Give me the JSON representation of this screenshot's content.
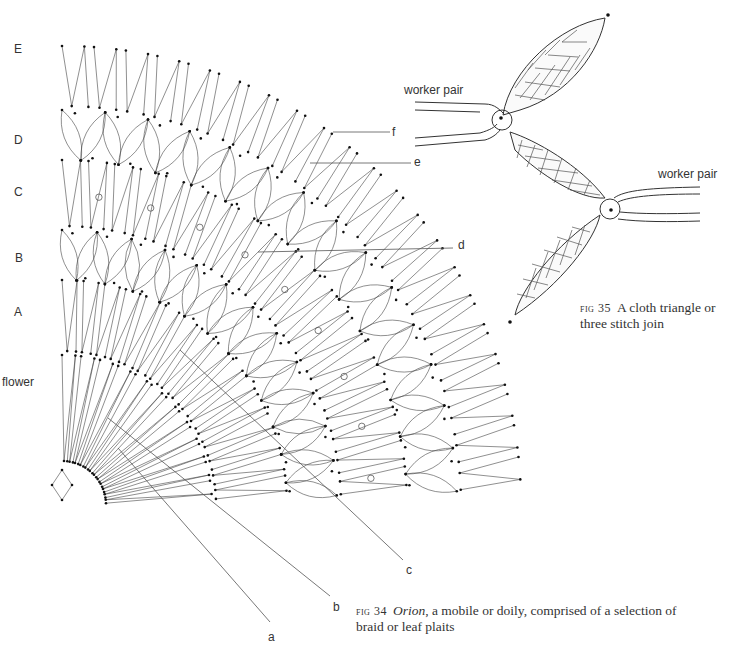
{
  "figure34": {
    "section_labels": [
      {
        "id": "E",
        "text": "E",
        "x": 14,
        "y": 70
      },
      {
        "id": "D",
        "text": "D",
        "x": 14,
        "y": 130
      },
      {
        "id": "C",
        "text": "C",
        "x": 14,
        "y": 184
      },
      {
        "id": "B",
        "text": "B",
        "x": 14,
        "y": 251
      },
      {
        "id": "A",
        "text": "A",
        "x": 14,
        "y": 306
      },
      {
        "id": "flower",
        "text": "flower",
        "x": 3,
        "y": 375
      }
    ],
    "callouts": [
      {
        "id": "a",
        "text": "a",
        "x": 271,
        "y": 630
      },
      {
        "id": "b",
        "text": "b",
        "x": 334,
        "y": 602
      },
      {
        "id": "c",
        "text": "c",
        "x": 407,
        "y": 565
      },
      {
        "id": "d",
        "text": "d",
        "x": 456,
        "y": 236
      },
      {
        "id": "e",
        "text": "e",
        "x": 414,
        "y": 155
      },
      {
        "id": "f",
        "text": "f",
        "x": 390,
        "y": 125
      }
    ],
    "caption": {
      "fig_number": "fig 34",
      "title": "Orion",
      "text": ", a mobile or doily, comprised of a selection of",
      "line2": "braid or leaf plaits"
    }
  },
  "figure35": {
    "labels": [
      {
        "id": "worker-pair-left",
        "text": "worker pair",
        "x": 404,
        "y": 83
      },
      {
        "id": "worker-pair-right",
        "text": "worker pair",
        "x": 658,
        "y": 167
      }
    ],
    "caption": {
      "fig_number": "fig 35",
      "text": "A cloth triangle or",
      "line2": "three stitch join"
    }
  },
  "geometry": {
    "center": [
      62,
      505
    ],
    "rings": [
      {
        "name": "E",
        "outer": 459,
        "inner": 395,
        "type": "zigzag",
        "count": 22
      },
      {
        "name": "D",
        "outer": 395,
        "inner": 345,
        "type": "leaf",
        "count": 14
      },
      {
        "name": "C",
        "outer": 345,
        "inner": 275,
        "type": "zigzag",
        "count": 20,
        "holes": 9
      },
      {
        "name": "B",
        "outer": 275,
        "inner": 225,
        "type": "leaf",
        "count": 12
      },
      {
        "name": "A",
        "outer": 225,
        "inner": 150,
        "type": "zigzag",
        "count": 16
      },
      {
        "name": "flower",
        "outer": 150,
        "inner": 40,
        "type": "zigzag",
        "count": 12
      }
    ],
    "colors": {
      "line": "#444444",
      "dot": "#111111"
    }
  }
}
